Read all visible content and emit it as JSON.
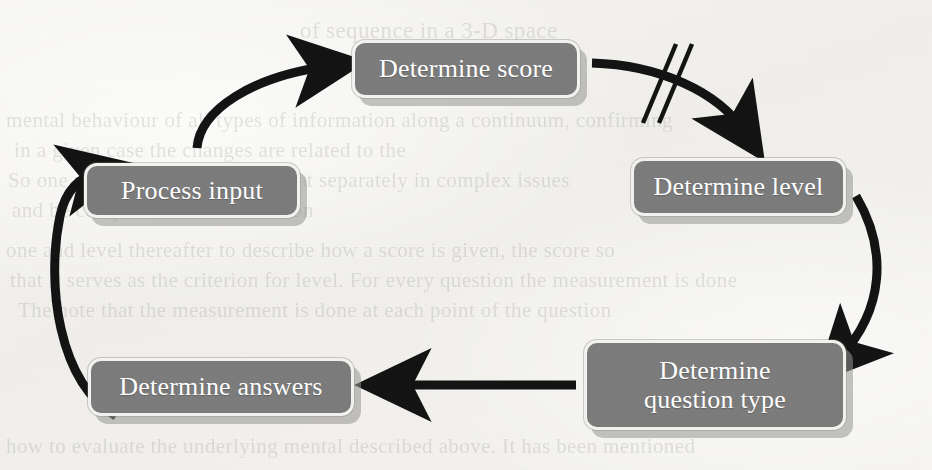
{
  "diagram": {
    "type": "cycle-flowchart",
    "canvas": {
      "width": 932,
      "height": 470
    },
    "colors": {
      "node_fill": "#7c7c7c",
      "node_text": "#ffffff",
      "node_border": "#f3f2ef",
      "node_shadow": "#969694",
      "arrow": "#141414",
      "background": "#f3f2ef"
    },
    "nodes": [
      {
        "id": "process",
        "label": "Process input",
        "lines": [
          "Process input"
        ]
      },
      {
        "id": "score",
        "label": "Determine score",
        "lines": [
          "Determine score"
        ]
      },
      {
        "id": "level",
        "label": "Determine level",
        "lines": [
          "Determine level"
        ]
      },
      {
        "id": "qtype",
        "label": "Determine question type",
        "lines": [
          "Determine",
          "question type"
        ]
      },
      {
        "id": "answers",
        "label": "Determine answers",
        "lines": [
          "Determine answers"
        ]
      }
    ],
    "edges": [
      {
        "id": "e1",
        "from": "process",
        "to": "score",
        "style": "curved-arrow",
        "direction": "up-right",
        "break_mark": false
      },
      {
        "id": "e2",
        "from": "score",
        "to": "level",
        "style": "curved-arrow",
        "direction": "down-right",
        "break_mark": true
      },
      {
        "id": "e3",
        "from": "level",
        "to": "qtype",
        "style": "curved-arrow",
        "direction": "down",
        "break_mark": false
      },
      {
        "id": "e4",
        "from": "qtype",
        "to": "answers",
        "style": "straight-arrow",
        "direction": "left",
        "break_mark": false
      },
      {
        "id": "e5",
        "from": "answers",
        "to": "process",
        "style": "curved-arrow",
        "direction": "up",
        "break_mark": false
      }
    ],
    "annotations": [
      {
        "id": "break-slashes",
        "name": "double-slash-break-mark",
        "on_edge": "e2",
        "symbol": "//"
      }
    ]
  },
  "background_text": {
    "description": "faint bleed-through text from reverse of scanned page",
    "lines": [
      {
        "id": "bg1",
        "text": "of sequence in a 3-D space"
      },
      {
        "id": "bg2",
        "text": "mental behaviour of all types of information along a continuum, confirming"
      },
      {
        "id": "bg3",
        "text": "in a given case the changes are related to the"
      },
      {
        "id": "bg4",
        "text": "So one needs to treat measurement separately in complex issues"
      },
      {
        "id": "bg5",
        "text": "and be compared to the discussion"
      },
      {
        "id": "bg6",
        "text": "one and level thereafter to describe how a score is given, the score so"
      },
      {
        "id": "bg7",
        "text": "that it serves as the criterion for level. For every question the measurement is done"
      },
      {
        "id": "bg8",
        "text": "The note that the measurement is done at each point of the question"
      },
      {
        "id": "bg9",
        "text": "how to evaluate the underlying mental described above. It has been mentioned"
      }
    ]
  }
}
